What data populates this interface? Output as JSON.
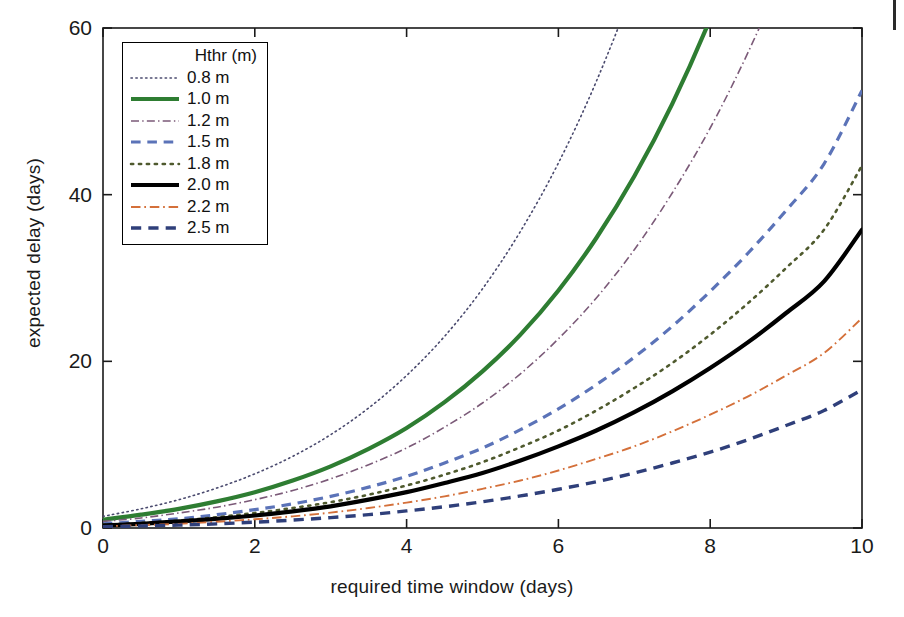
{
  "chart_data": {
    "type": "line",
    "title": "",
    "xlabel": "required time window (days)",
    "ylabel": "expected delay (days)",
    "xlim": [
      0,
      10
    ],
    "ylim": [
      0,
      60
    ],
    "xticks": [
      0,
      2,
      4,
      6,
      8,
      10
    ],
    "yticks": [
      0,
      20,
      40,
      60
    ],
    "grid": false,
    "legend_position": "upper-left",
    "legend_title": "Hthr (m)",
    "x": [
      0,
      0.5,
      1,
      1.5,
      2,
      2.5,
      3,
      3.5,
      4,
      4.5,
      5,
      5.5,
      6,
      6.5,
      7,
      7.5,
      8,
      8.5,
      9,
      9.5,
      10
    ],
    "series": [
      {
        "name": "0.8 m",
        "label": "0.8 m",
        "color": "#4a4a6e",
        "style": "dotted",
        "width": 1.6,
        "values": [
          1.4,
          2.3,
          3.4,
          4.8,
          6.5,
          8.6,
          11.2,
          14.4,
          18.3,
          23.0,
          28.7,
          35.6,
          43.8,
          53.6,
          65.2,
          79.0,
          95.0,
          113.5,
          135.0,
          159.5,
          187.0
        ]
      },
      {
        "name": "1.0 m",
        "label": "1.0 m",
        "color": "#2e7d32",
        "style": "solid",
        "width": 4.2,
        "values": [
          1.0,
          1.6,
          2.3,
          3.2,
          4.3,
          5.7,
          7.4,
          9.5,
          12.0,
          15.1,
          18.8,
          23.2,
          28.5,
          34.8,
          42.2,
          50.9,
          61.1,
          73.0,
          86.7,
          102.5,
          120.5
        ]
      },
      {
        "name": "1.2 m",
        "label": "1.2 m",
        "color": "#7b5a78",
        "style": "dashdot",
        "width": 1.6,
        "values": [
          0.8,
          1.2,
          1.8,
          2.5,
          3.4,
          4.5,
          5.9,
          7.6,
          9.6,
          12.1,
          15.0,
          18.5,
          22.7,
          27.6,
          33.4,
          40.2,
          48.0,
          57.1,
          67.5,
          79.4,
          93.0
        ]
      },
      {
        "name": "1.5 m",
        "label": "1.5 m",
        "color": "#5b73b8",
        "style": "dashed",
        "width": 3.2,
        "values": [
          0.5,
          0.8,
          1.1,
          1.6,
          2.2,
          2.9,
          3.8,
          4.9,
          6.2,
          7.8,
          9.6,
          11.8,
          14.3,
          17.2,
          20.5,
          24.2,
          28.4,
          33.0,
          38.1,
          43.7,
          52.5
        ]
      },
      {
        "name": "1.8 m",
        "label": "1.8 m",
        "color": "#4f5a2e",
        "style": "dotted",
        "width": 2.6,
        "values": [
          0.4,
          0.6,
          0.9,
          1.3,
          1.8,
          2.4,
          3.1,
          4.0,
          5.1,
          6.4,
          7.9,
          9.7,
          11.7,
          14.1,
          16.8,
          19.8,
          23.2,
          27.0,
          31.2,
          35.8,
          43.5
        ]
      },
      {
        "name": "2.0 m",
        "label": "2.0 m",
        "color": "#000000",
        "style": "solid",
        "width": 4.2,
        "values": [
          0.3,
          0.5,
          0.8,
          1.1,
          1.5,
          2.0,
          2.6,
          3.4,
          4.3,
          5.4,
          6.6,
          8.1,
          9.8,
          11.7,
          13.9,
          16.4,
          19.2,
          22.3,
          25.8,
          29.6,
          35.8
        ]
      },
      {
        "name": "2.2 m",
        "label": "2.2 m",
        "color": "#d4703a",
        "style": "dashdot",
        "width": 1.9,
        "values": [
          0.2,
          0.35,
          0.5,
          0.75,
          1.05,
          1.4,
          1.85,
          2.4,
          3.05,
          3.8,
          4.7,
          5.7,
          6.9,
          8.3,
          9.8,
          11.6,
          13.6,
          15.8,
          18.3,
          21.0,
          25.2
        ]
      },
      {
        "name": "2.5 m",
        "label": "2.5 m",
        "color": "#2f3f7a",
        "style": "dashed",
        "width": 3.4,
        "values": [
          0.15,
          0.25,
          0.35,
          0.5,
          0.7,
          0.95,
          1.25,
          1.6,
          2.05,
          2.55,
          3.15,
          3.85,
          4.65,
          5.55,
          6.6,
          7.8,
          9.1,
          10.6,
          12.3,
          14.1,
          16.6
        ]
      }
    ]
  },
  "axes": {
    "xlabel": "required time window (days)",
    "ylabel": "expected delay (days)",
    "xtick_labels": [
      "0",
      "2",
      "4",
      "6",
      "8",
      "10"
    ],
    "ytick_labels": [
      "0",
      "20",
      "40",
      "60"
    ]
  },
  "legend": {
    "title": "Hthr (m)",
    "entries": [
      "0.8 m",
      "1.0 m",
      "1.2 m",
      "1.5 m",
      "1.8 m",
      "2.0 m",
      "2.2 m",
      "2.5 m"
    ]
  },
  "colors": {
    "axis": "#1a1a1a",
    "background": "#ffffff",
    "series_0_8": "#4a4a6e",
    "series_1_0": "#2e7d32",
    "series_1_2": "#7b5a78",
    "series_1_5": "#5b73b8",
    "series_1_8": "#4f5a2e",
    "series_2_0": "#000000",
    "series_2_2": "#d4703a",
    "series_2_5": "#2f3f7a"
  }
}
